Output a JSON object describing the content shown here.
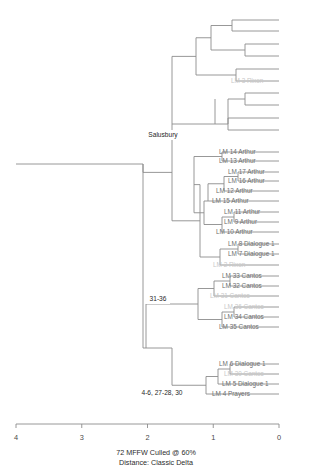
{
  "chart_data": {
    "type": "dendrogram",
    "title": "",
    "caption_line_1": "72 MFFW  Culled @ 60%",
    "caption_line_2": "Distance: Classic Delta",
    "xlabel": "",
    "ylabel": "",
    "axis": {
      "orientation": "horizontal-bottom",
      "direction": "right-to-left",
      "min": 0,
      "max": 4,
      "tick_labels": [
        "4",
        "3",
        "2",
        "1",
        "0"
      ],
      "tick_values": [
        4,
        3,
        2,
        1,
        0
      ],
      "pixel_left": 16,
      "pixel_right": 279,
      "grid": false,
      "legend": "none"
    },
    "colors": {
      "branch": "#8c8c8c",
      "label_normal": "#6f6f6f",
      "label_mid": "#c8c8c8",
      "label_faint": "#e3e3e3",
      "annotation": "#1f1f1f",
      "background": "#ffffff"
    },
    "node_annotations": [
      {
        "label": "Salusbury",
        "x": 163,
        "y": 135
      },
      {
        "label": "31-36",
        "x": 158,
        "y": 299
      },
      {
        "label": "4-6, 27-28, 30",
        "x": 162,
        "y": 393
      }
    ],
    "leaves": [
      {
        "label": "",
        "y": 20,
        "x": 232,
        "shade": "faint"
      },
      {
        "label": "",
        "y": 31,
        "x": 232,
        "shade": "faint"
      },
      {
        "label": "",
        "y": 44,
        "x": 245,
        "shade": "faint"
      },
      {
        "label": "",
        "y": 56,
        "x": 245,
        "shade": "faint"
      },
      {
        "label": "",
        "y": 69,
        "x": 236,
        "shade": "faint"
      },
      {
        "label": "LM 3 Rixon",
        "y": 81,
        "x": 231,
        "shade": "mid"
      },
      {
        "label": "",
        "y": 93,
        "x": 245,
        "shade": "faint"
      },
      {
        "label": "",
        "y": 105,
        "x": 245,
        "shade": "faint"
      },
      {
        "label": "",
        "y": 118,
        "x": 228,
        "shade": "faint"
      },
      {
        "label": "",
        "y": 130,
        "x": 228,
        "shade": "faint"
      },
      {
        "label": "",
        "y": 142,
        "x": 222,
        "shade": "faint"
      },
      {
        "label": "LM 14 Arthur",
        "y": 152,
        "x": 219,
        "shade": "normal"
      },
      {
        "label": "LM 13 Arthur",
        "y": 161,
        "x": 219,
        "shade": "normal"
      },
      {
        "label": "LM 17 Arthur",
        "y": 172,
        "x": 228,
        "shade": "normal"
      },
      {
        "label": "LM 16 Arthur",
        "y": 181,
        "x": 228,
        "shade": "normal"
      },
      {
        "label": "LM 12 Arthur",
        "y": 191,
        "x": 216,
        "shade": "normal"
      },
      {
        "label": "LM 15 Arthur",
        "y": 201,
        "x": 212,
        "shade": "normal"
      },
      {
        "label": "LM 11 Arthur",
        "y": 212,
        "x": 224,
        "shade": "normal"
      },
      {
        "label": "LM 9 Arthur",
        "y": 222,
        "x": 224,
        "shade": "normal"
      },
      {
        "label": "LM 10 Arthur",
        "y": 232,
        "x": 216,
        "shade": "normal"
      },
      {
        "label": "LM 8 Dialogue 1",
        "y": 244,
        "x": 228,
        "shade": "normal"
      },
      {
        "label": "LM 7 Dialogue 1",
        "y": 254,
        "x": 228,
        "shade": "normal"
      },
      {
        "label": "LM 2 Rixon",
        "y": 265,
        "x": 213,
        "shade": "mid"
      },
      {
        "label": "LM 33 Cantos",
        "y": 276,
        "x": 222,
        "shade": "normal"
      },
      {
        "label": "LM 32 Cantos",
        "y": 286,
        "x": 222,
        "shade": "normal"
      },
      {
        "label": "LM 31 Cantos",
        "y": 296,
        "x": 210,
        "shade": "mid"
      },
      {
        "label": "LM 36 Cantos",
        "y": 307,
        "x": 224,
        "shade": "mid"
      },
      {
        "label": "LM 34 Cantos",
        "y": 317,
        "x": 224,
        "shade": "normal"
      },
      {
        "label": "LM 35 Cantos",
        "y": 327,
        "x": 219,
        "shade": "normal"
      },
      {
        "label": "LM 6 Dialogue 1",
        "y": 364,
        "x": 219,
        "shade": "normal"
      },
      {
        "label": "LM 30 Cantos",
        "y": 374,
        "x": 224,
        "shade": "mid"
      },
      {
        "label": "LM 5 Dialogue 1",
        "y": 384,
        "x": 222,
        "shade": "normal"
      },
      {
        "label": "LM 4 Prayers",
        "y": 394,
        "x": 212,
        "shade": "normal"
      }
    ],
    "branch_paths": [
      "M 279 20 L 232 20 L 232 31 L 279 31",
      "M 232 25.5 L 211 25.5 L 211 50 L 245 50",
      "M 279 44 L 245 44 L 245 56 L 279 56",
      "M 211 37.75 L 196 37.75 L 196 75 L 236 75",
      "M 279 69 L 236 69 L 236 81 L 279 81",
      "M 279 93 L 245 93 L 245 105 L 279 105",
      "M 245 99 L 228 99 L 228 124 L 228 124",
      "M 279 118 L 228 118 L 228 130 L 279 130",
      "M 228 124 L 215 124 L 215 99",
      "M 196 56.4 L 172 56.4 L 172 124 L 215 124",
      "M 279 152 L 222 152 L 222 161 L 279 161",
      "M 279 172 L 238 172 L 238 181 L 279 181",
      "M 238 176.5 L 224 176.5 L 224 191 L 279 191",
      "M 224 183.75 L 208 183.75 L 208 201 L 279 201",
      "M 279 212 L 234 212 L 234 222 L 279 222",
      "M 234 217 L 222 217 L 222 232 L 279 232",
      "M 222 224.5 L 204 224.5 L 204 201 L 208 201",
      "M 204 212.75 L 194 212.75 L 194 156.5 L 222 156.5",
      "M 279 244 L 238 244 L 238 254 L 279 254",
      "M 238 249 L 220 249 L 220 265 L 279 265",
      "M 220 257 L 200 257 L 200 184.6 L 194 184.6",
      "M 200 220.8 L 172 220.8 L 172 124",
      "M 172 172.4 L 143 172.4 L 143 164 L 16 164",
      "M 279 276 L 230 276 L 230 286 L 279 286",
      "M 230 281 L 214 281 L 214 296 L 279 296",
      "M 279 307 L 234 307 L 234 317 L 279 317",
      "M 234 312 L 222 312 L 222 327 L 279 327",
      "M 222 319.5 L 198 319.5 L 198 288.5 L 214 288.5",
      "M 198 304 L 146 304 L 146 348 L 146 348",
      "M 279 364 L 230 364 L 230 374 L 279 374",
      "M 230 369 L 218 369 L 218 384 L 279 384",
      "M 218 376.5 L 206 376.5 L 206 394 L 279 394",
      "M 206 385.25 L 172 385.25 L 172 348 L 146 348",
      "M 146 348 L 143 348 L 143 164"
    ]
  }
}
